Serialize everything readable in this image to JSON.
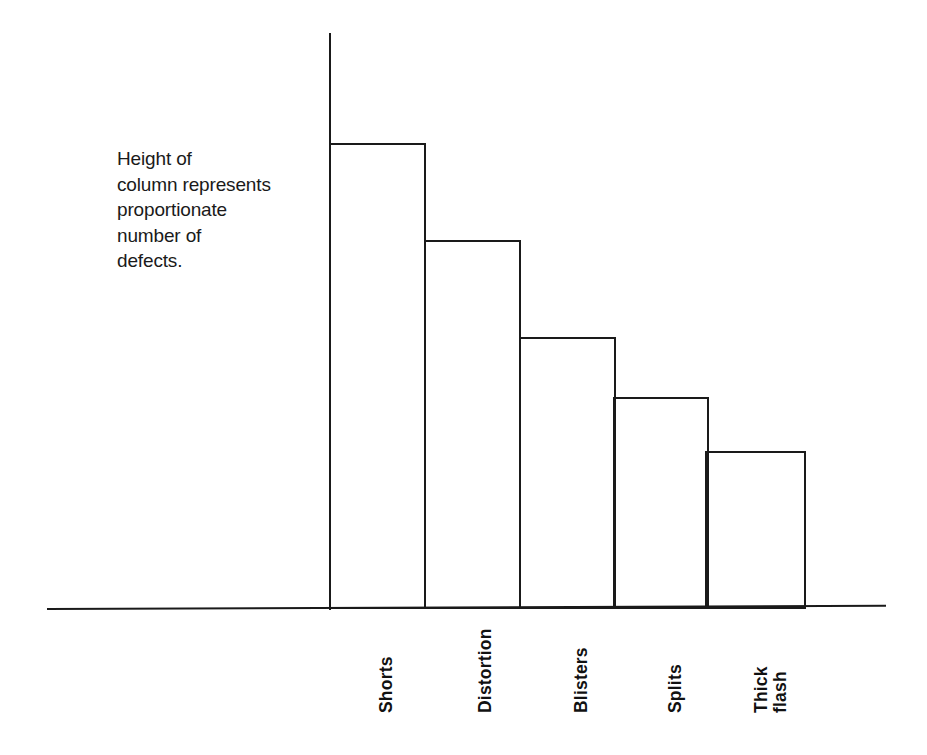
{
  "annotation": {
    "text": "Height of\ncolumn represents\nproportionate\nnumber of\ndefects."
  },
  "axes": {
    "y_axis_name": "vertical-axis",
    "x_axis_name": "horizontal-axis"
  },
  "chart_data": {
    "type": "bar",
    "title": "",
    "subtitle": "",
    "xlabel": "",
    "ylabel": "",
    "categories": [
      "Shorts",
      "Distortion",
      "Blisters",
      "Splits",
      "Thick flash"
    ],
    "values": [
      100,
      79,
      58,
      45,
      34
    ],
    "value_unit": "relative number of defects",
    "ylim": [
      0,
      124
    ],
    "grid": false,
    "legend": false,
    "legend_position": "none",
    "annotations": [
      "Height of column represents proportionate number of defects."
    ],
    "tick_labels_rotated": true,
    "bar_style": "outlined, unfilled",
    "series": [
      {
        "name": "Defects",
        "values": [
          100,
          79,
          58,
          45,
          34
        ]
      }
    ]
  },
  "bars": [
    {
      "label": "Shorts",
      "left": 329,
      "width": 97,
      "height": 466,
      "label_center_x": 372,
      "label_top": 623
    },
    {
      "label": "Distortion",
      "left": 424,
      "width": 97,
      "height": 369,
      "label_center_x": 471,
      "label_top": 623
    },
    {
      "label": "Blisters",
      "left": 519,
      "width": 97,
      "height": 272,
      "label_center_x": 567,
      "label_top": 623
    },
    {
      "label": "Splits",
      "left": 613,
      "width": 96,
      "height": 212,
      "label_center_x": 661,
      "label_top": 623
    },
    {
      "label": "Thick flash",
      "left": 705,
      "width": 101,
      "height": 158,
      "label_center_x": 757,
      "label_top": 623
    }
  ]
}
